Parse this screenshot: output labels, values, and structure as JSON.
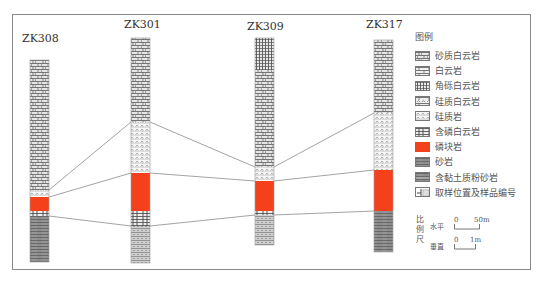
{
  "figure": {
    "frame_color": "#8a8a8a",
    "correlation_line_color": "#8c8c8c"
  },
  "wells": [
    {
      "id": "ZK308",
      "label": "ZK308",
      "x": 30,
      "width": 19,
      "label_x": 22,
      "label_y": 32,
      "layers": [
        {
          "lithology": "sandy_dolomite",
          "top": 60,
          "bottom": 190
        },
        {
          "lithology": "siliceous_rock",
          "top": 190,
          "bottom": 197
        },
        {
          "lithology": "phosphorite",
          "top": 197,
          "bottom": 211
        },
        {
          "lithology": "phosphatic_dolomite",
          "top": 211,
          "bottom": 216
        },
        {
          "lithology": "sandstone",
          "top": 216,
          "bottom": 262
        }
      ]
    },
    {
      "id": "ZK301",
      "label": "ZK301",
      "x": 131,
      "width": 19,
      "label_x": 124,
      "label_y": 18,
      "layers": [
        {
          "lithology": "sandy_dolomite",
          "top": 38,
          "bottom": 122
        },
        {
          "lithology": "siliceous_rock",
          "top": 122,
          "bottom": 173
        },
        {
          "lithology": "phosphorite",
          "top": 173,
          "bottom": 211
        },
        {
          "lithology": "phosphatic_dolomite",
          "top": 211,
          "bottom": 226
        },
        {
          "lithology": "clayey_silty_sandstone",
          "top": 226,
          "bottom": 263
        }
      ]
    },
    {
      "id": "ZK309",
      "label": "ZK309",
      "x": 255,
      "width": 19,
      "label_x": 247,
      "label_y": 20,
      "layers": [
        {
          "lithology": "brecciated_dolomite",
          "top": 38,
          "bottom": 70
        },
        {
          "lithology": "sandy_dolomite",
          "top": 70,
          "bottom": 167
        },
        {
          "lithology": "siliceous_rock",
          "top": 167,
          "bottom": 181
        },
        {
          "lithology": "phosphorite",
          "top": 181,
          "bottom": 211
        },
        {
          "lithology": "phosphatic_dolomite",
          "top": 211,
          "bottom": 215
        },
        {
          "lithology": "clayey_silty_sandstone",
          "top": 215,
          "bottom": 245
        }
      ]
    },
    {
      "id": "ZK317",
      "label": "ZK317",
      "x": 374,
      "width": 19,
      "label_x": 366,
      "label_y": 18,
      "layers": [
        {
          "lithology": "sandy_dolomite",
          "top": 40,
          "bottom": 113
        },
        {
          "lithology": "siliceous_rock",
          "top": 113,
          "bottom": 170
        },
        {
          "lithology": "phosphorite",
          "top": 170,
          "bottom": 211
        },
        {
          "lithology": "sandstone",
          "top": 211,
          "bottom": 252
        }
      ]
    }
  ],
  "correlation_lines": [
    {
      "name": "siliceous-top",
      "points": [
        [
          49,
          190
        ],
        [
          131,
          122
        ],
        [
          150,
          122
        ],
        [
          255,
          167
        ],
        [
          274,
          167
        ],
        [
          374,
          113
        ]
      ]
    },
    {
      "name": "phosphorite-top",
      "points": [
        [
          49,
          197
        ],
        [
          131,
          173
        ],
        [
          150,
          173
        ],
        [
          255,
          181
        ],
        [
          274,
          181
        ],
        [
          374,
          170
        ]
      ]
    },
    {
      "name": "phosphorite-base",
      "points": [
        [
          49,
          216
        ],
        [
          131,
          226
        ],
        [
          150,
          226
        ],
        [
          255,
          215
        ],
        [
          274,
          215
        ],
        [
          374,
          211
        ]
      ]
    }
  ],
  "legend": {
    "title": "图例",
    "items": [
      {
        "key": "sandy_dolomite",
        "label": "砂质白云岩"
      },
      {
        "key": "dolomite",
        "label": "白云岩"
      },
      {
        "key": "brecciated_dolomite",
        "label": "角砾白云岩"
      },
      {
        "key": "siliceous_dolomite",
        "label": "硅质白云岩"
      },
      {
        "key": "siliceous_rock",
        "label": "硅质岩"
      },
      {
        "key": "phosphatic_dolomite",
        "label": "含磷白云岩"
      },
      {
        "key": "phosphorite",
        "label": "磷块岩"
      },
      {
        "key": "sandstone",
        "label": "砂岩"
      },
      {
        "key": "clayey_silty_sandstone",
        "label": "含黏土质粉砂岩"
      },
      {
        "key": "sample_location",
        "label": "取样位置及样品编号"
      }
    ]
  },
  "scale": {
    "title": "比例尺",
    "horizontal": {
      "label": "水平",
      "zero": "0",
      "value": "50m"
    },
    "vertical": {
      "label": "垂直",
      "zero": "0",
      "value": "1m"
    }
  },
  "colors": {
    "phosphorite": "#f5401c",
    "rock_fill": "#e4e4e4",
    "rock_line": "#6e6e6e",
    "sandstone_fill": "#8f8f8f"
  }
}
